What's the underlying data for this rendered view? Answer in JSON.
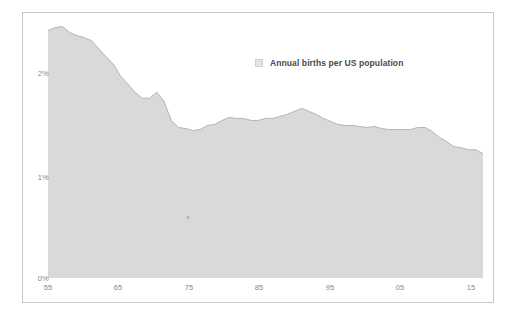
{
  "legend": {
    "series_label": "Annual births per US population",
    "swatch_icon": "legend-square-icon",
    "swatch_color": "#e4e4e4"
  },
  "axes": {
    "y_ticks": [
      "0%",
      "1%",
      "2%"
    ],
    "x_ticks": [
      "55",
      "65",
      "75",
      "85",
      "95",
      "05",
      "15"
    ]
  },
  "style": {
    "fill_color": "#d9d9d9",
    "stroke_color": "#b5b5b5",
    "border_color": "#c8c8c8",
    "tick_text_color": "#888888"
  },
  "chart_data": {
    "type": "area",
    "title": "",
    "subtitle": "",
    "xlabel": "",
    "ylabel": "",
    "legend_position": "top-right",
    "grid": false,
    "xlim": [
      1955,
      2015
    ],
    "ylim": [
      0,
      3
    ],
    "ytick_values": [
      0,
      1,
      2
    ],
    "ytick_labels": [
      "0%",
      "1%",
      "2%"
    ],
    "xtick_values": [
      1955,
      1965,
      1975,
      1985,
      1995,
      2005,
      2015
    ],
    "xtick_labels": [
      "55",
      "65",
      "75",
      "85",
      "95",
      "05",
      "15"
    ],
    "series": [
      {
        "name": "Annual births per US population",
        "unit": "percent",
        "x": [
          1955,
          1956,
          1957,
          1958,
          1959,
          1960,
          1961,
          1962,
          1963,
          1964,
          1965,
          1966,
          1967,
          1968,
          1969,
          1970,
          1971,
          1972,
          1973,
          1974,
          1975,
          1976,
          1977,
          1978,
          1979,
          1980,
          1981,
          1982,
          1983,
          1984,
          1985,
          1986,
          1987,
          1988,
          1989,
          1990,
          1991,
          1992,
          1993,
          1994,
          1995,
          1996,
          1997,
          1998,
          1999,
          2000,
          2001,
          2002,
          2003,
          2004,
          2005,
          2006,
          2007,
          2008,
          2009,
          2010,
          2011,
          2012,
          2013,
          2014,
          2015
        ],
        "values": [
          2.45,
          2.48,
          2.49,
          2.43,
          2.4,
          2.38,
          2.35,
          2.27,
          2.19,
          2.12,
          2.0,
          1.92,
          1.84,
          1.78,
          1.78,
          1.84,
          1.75,
          1.56,
          1.49,
          1.48,
          1.46,
          1.47,
          1.51,
          1.52,
          1.56,
          1.59,
          1.58,
          1.58,
          1.56,
          1.56,
          1.58,
          1.58,
          1.6,
          1.62,
          1.65,
          1.68,
          1.65,
          1.62,
          1.58,
          1.55,
          1.52,
          1.51,
          1.51,
          1.5,
          1.49,
          1.5,
          1.48,
          1.47,
          1.47,
          1.47,
          1.47,
          1.49,
          1.49,
          1.45,
          1.39,
          1.35,
          1.3,
          1.29,
          1.27,
          1.27,
          1.23
        ]
      }
    ],
    "annotations": []
  }
}
